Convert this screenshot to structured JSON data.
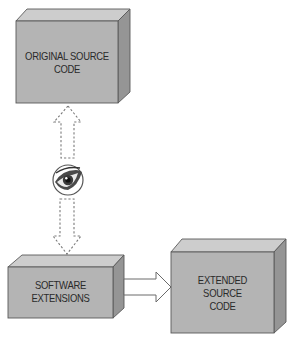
{
  "diagram": {
    "nodes": [
      {
        "id": "original-source-code",
        "label_lines": [
          "ORIGINAL SOURCE",
          "CODE"
        ]
      },
      {
        "id": "software-extensions",
        "label_lines": [
          "SOFTWARE",
          "EXTENSIONS"
        ]
      },
      {
        "id": "extended-source-code",
        "label_lines": [
          "EXTENDED",
          "SOURCE",
          "CODE"
        ]
      }
    ],
    "connectors": [
      {
        "from": "software-extensions",
        "to": "original-source-code",
        "style": "dashed",
        "via": "eye-icon"
      },
      {
        "from": "software-extensions",
        "to": "extended-source-code",
        "style": "solid"
      }
    ],
    "icons": {
      "observer": "eye-icon"
    },
    "colors": {
      "box_front": "#b4b4b4",
      "box_top": "#cdcdcd",
      "box_side": "#959595",
      "outline": "#5a5a5a",
      "text": "#2a2a2a"
    }
  }
}
